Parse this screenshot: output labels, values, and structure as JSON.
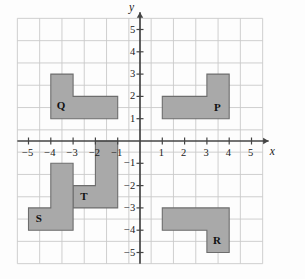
{
  "figure": {
    "type": "coordinate-plane-diagram",
    "background_color": "#fdfdfd",
    "grid": {
      "visible": true,
      "line_color": "#c9c9c9",
      "x_min": -5.5,
      "x_max": 5.5,
      "y_min": -5.5,
      "y_max": 5.5,
      "step": 1
    },
    "axes": {
      "color": "#444444",
      "x_label": "x",
      "y_label": "y",
      "x_ticks": [
        -5,
        -4,
        -3,
        -2,
        -1,
        1,
        2,
        3,
        4,
        5
      ],
      "y_ticks": [
        5,
        4,
        3,
        2,
        1,
        -1,
        -2,
        -3,
        -4,
        -5
      ],
      "x_tick_labels": [
        "−5",
        "−4",
        "−3",
        "−2",
        "−1",
        "1",
        "2",
        "3",
        "4",
        "5"
      ],
      "y_tick_labels": [
        "5",
        "4",
        "3",
        "2",
        "1",
        "−1",
        "−2",
        "−3",
        "−4",
        "−5"
      ]
    },
    "shapes": [
      {
        "id": "Q",
        "label": "Q",
        "quadrant": "II",
        "fill": "#a9a9a9",
        "stroke": "#6d6d6d",
        "label_x": -3.55,
        "label_y": 1.55,
        "vertices": [
          [
            -4,
            3
          ],
          [
            -3,
            3
          ],
          [
            -3,
            2
          ],
          [
            -1,
            2
          ],
          [
            -1,
            1
          ],
          [
            -4,
            1
          ]
        ]
      },
      {
        "id": "P",
        "label": "P",
        "quadrant": "I",
        "fill": "#a9a9a9",
        "stroke": "#6d6d6d",
        "label_x": 3.5,
        "label_y": 1.5,
        "vertices": [
          [
            1,
            2
          ],
          [
            3,
            2
          ],
          [
            3,
            3
          ],
          [
            4,
            3
          ],
          [
            4,
            1
          ],
          [
            1,
            1
          ]
        ]
      },
      {
        "id": "T",
        "label": "T",
        "quadrant": "III",
        "fill": "#a9a9a9",
        "stroke": "#6d6d6d",
        "label_x": -2.5,
        "label_y": -2.5,
        "vertices": [
          [
            -2,
            0
          ],
          [
            -1,
            0
          ],
          [
            -1,
            -3
          ],
          [
            -3,
            -3
          ],
          [
            -3,
            -2
          ],
          [
            -2,
            -2
          ]
        ]
      },
      {
        "id": "S",
        "label": "S",
        "quadrant": "III",
        "fill": "#a9a9a9",
        "stroke": "#6d6d6d",
        "label_x": -4.5,
        "label_y": -3.5,
        "vertices": [
          [
            -4,
            -1
          ],
          [
            -3,
            -1
          ],
          [
            -3,
            -4
          ],
          [
            -5,
            -4
          ],
          [
            -5,
            -3
          ],
          [
            -4,
            -3
          ]
        ]
      },
      {
        "id": "R",
        "label": "R",
        "quadrant": "IV",
        "fill": "#a9a9a9",
        "stroke": "#6d6d6d",
        "label_x": 3.45,
        "label_y": -4.5,
        "vertices": [
          [
            1,
            -3
          ],
          [
            4,
            -3
          ],
          [
            4,
            -5
          ],
          [
            3,
            -5
          ],
          [
            3,
            -4
          ],
          [
            1,
            -4
          ]
        ]
      }
    ]
  },
  "chart_data": {
    "type": "scatter",
    "title": "",
    "xlabel": "x",
    "ylabel": "y",
    "xlim": [
      -5.5,
      5.5
    ],
    "ylim": [
      -5.5,
      5.5
    ],
    "grid": true,
    "legend": "none",
    "annotations": [
      "Q",
      "P",
      "T",
      "S",
      "R"
    ]
  }
}
